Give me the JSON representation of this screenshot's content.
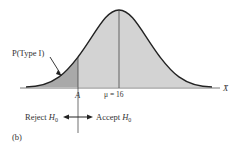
{
  "diagram": {
    "type_i_label": "P(Type I)",
    "critical_value_label": "A",
    "mean_label": "μ = 16",
    "axis_label": "X̄",
    "reject_label": "Reject",
    "accept_label": "Accept",
    "hypothesis": "H",
    "hypothesis_sub": "0",
    "panel_label": "(b)",
    "colors": {
      "curve": "#222222",
      "shade_main": "#d3d3d3",
      "shade_tail": "#a9a9a9",
      "axis": "#555555"
    }
  }
}
